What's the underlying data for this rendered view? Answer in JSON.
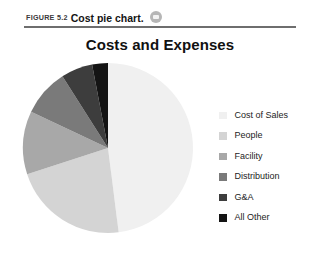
{
  "caption": {
    "figure_label": "FIGURE 5.2",
    "figure_title": "Cost pie chart.",
    "badge_icon": "media-badge-icon"
  },
  "chart_data": {
    "type": "pie",
    "title": "Costs and Expenses",
    "subtitle": "",
    "xlabel": "",
    "ylabel": "",
    "grid": false,
    "legend_position": "right",
    "start_angle_deg": 0,
    "direction": "clockwise",
    "categories": [
      "Cost of Sales",
      "People",
      "Facility",
      "Distribution",
      "G&A",
      "All Other"
    ],
    "values": [
      48,
      22,
      12,
      9,
      6,
      3
    ],
    "slices": [
      {
        "label": "Cost of Sales",
        "value": 48,
        "angle_deg": 172.8,
        "color": "#f0f0f0"
      },
      {
        "label": "People",
        "value": 22,
        "angle_deg": 79.2,
        "color": "#d4d4d4"
      },
      {
        "label": "Facility",
        "value": 12,
        "angle_deg": 43.2,
        "color": "#a8a8a8"
      },
      {
        "label": "Distribution",
        "value": 9,
        "angle_deg": 32.4,
        "color": "#7a7a7a"
      },
      {
        "label": "G&A",
        "value": 6,
        "angle_deg": 21.6,
        "color": "#3d3d3d"
      },
      {
        "label": "All Other",
        "value": 3,
        "angle_deg": 10.8,
        "color": "#141414"
      }
    ]
  },
  "legend": {
    "items": [
      {
        "label": "Cost of Sales",
        "color": "#f0f0f0"
      },
      {
        "label": "People",
        "color": "#d4d4d4"
      },
      {
        "label": "Facility",
        "color": "#a8a8a8"
      },
      {
        "label": "Distribution",
        "color": "#7a7a7a"
      },
      {
        "label": "G&A",
        "color": "#3d3d3d"
      },
      {
        "label": "All Other",
        "color": "#141414"
      }
    ]
  }
}
